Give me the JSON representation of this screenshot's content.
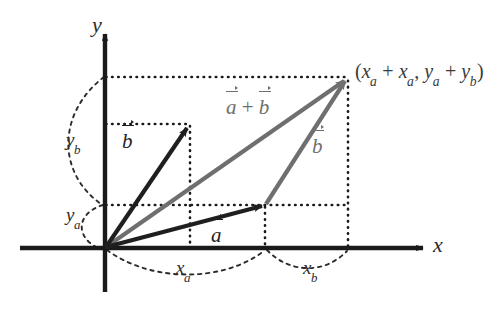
{
  "figure": {
    "kind": "vector-addition-diagram",
    "colors": {
      "axis": "#1a1a1a",
      "vector_a": "#1f1f1f",
      "vector_b_black": "#1f1f1f",
      "vector_sum_gray": "#6f6f6f",
      "vector_b_gray": "#6f6f6f",
      "guide_dotted": "#1a1a1a",
      "arc_dashed": "#2b2b2b",
      "background": "#ffffff",
      "text": "#2b2b2b"
    }
  },
  "axes": {
    "x_label": "x",
    "y_label": "y",
    "origin_px": [
      105,
      248
    ]
  },
  "points": {
    "origin": [
      105,
      248
    ],
    "tip_a": [
      265,
      205
    ],
    "tip_b": [
      190,
      124
    ],
    "tip_sum": [
      348,
      77
    ]
  },
  "labels": {
    "vector_a": "a",
    "vector_b_black": "b",
    "vector_b_gray": "b",
    "vector_sum_left": "a",
    "vector_sum_op": " + ",
    "vector_sum_right": "b",
    "component_ya_base": "y",
    "component_ya_sub": "a",
    "component_yb_base": "y",
    "component_yb_sub": "b",
    "component_xa_base": "x",
    "component_xa_sub": "a",
    "component_xb_base": "x",
    "component_xb_sub": "b"
  },
  "sum_point_label": {
    "open_paren": "(",
    "t1_base": "x",
    "t1_sub": "a",
    "plus1": " + ",
    "t2_base": "x",
    "t2_sub": "a",
    "comma": ", ",
    "t3_base": "y",
    "t3_sub": "a",
    "plus2": " + ",
    "t4_base": "y",
    "t4_sub": "b",
    "close_paren": ")"
  }
}
